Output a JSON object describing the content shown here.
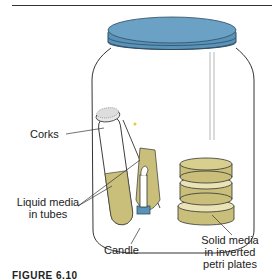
{
  "figure": {
    "caption": "FIGURE 6.10",
    "labels": {
      "corks": "Corks",
      "liquid_media_1": "Liquid media",
      "liquid_media_2": "in tubes",
      "candle": "Candle",
      "solid_media_1": "Solid media",
      "solid_media_2": "in inverted",
      "solid_media_3": "petri plates"
    },
    "colors": {
      "lid": "#5b93b8",
      "media": "#c9bf7a",
      "outline": "#333333"
    }
  }
}
